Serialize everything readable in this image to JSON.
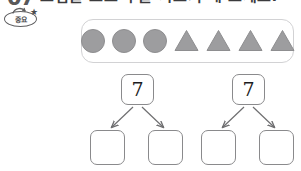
{
  "header": {
    "problem_number": "07",
    "title": "그림을 보고 수를 가르기 해 보세요.",
    "badge": {
      "label": "중요",
      "star_icon": "star-icon"
    }
  },
  "shapes_panel": {
    "items": [
      {
        "type": "circle",
        "icon": "circle-shape",
        "color": "#9d9d9f"
      },
      {
        "type": "circle",
        "icon": "circle-shape",
        "color": "#9d9d9f"
      },
      {
        "type": "circle",
        "icon": "circle-shape",
        "color": "#9d9d9f"
      },
      {
        "type": "triangle",
        "icon": "triangle-shape",
        "color": "#9d9d9f"
      },
      {
        "type": "triangle",
        "icon": "triangle-shape",
        "color": "#9d9d9f"
      },
      {
        "type": "triangle",
        "icon": "triangle-shape",
        "color": "#9d9d9f"
      },
      {
        "type": "triangle",
        "icon": "triangle-shape",
        "color": "#9d9d9f"
      }
    ],
    "circle_count": 3,
    "triangle_count": 4,
    "total_count": 7
  },
  "number_bonds": [
    {
      "id": "bond-left",
      "whole": "7",
      "parts": [
        "",
        ""
      ],
      "arrow_icon": "arrow-down-icon"
    },
    {
      "id": "bond-right",
      "whole": "7",
      "parts": [
        "",
        ""
      ],
      "arrow_icon": "arrow-down-icon"
    }
  ],
  "colors": {
    "shape_fill": "#9d9d9f",
    "shape_stroke": "#8e8e90",
    "panel_border": "#d2d2d4",
    "cell_border": "#8a8a8c",
    "arrow": "#6e6e70",
    "text": "#1c1c1e",
    "background": "#ffffff"
  }
}
